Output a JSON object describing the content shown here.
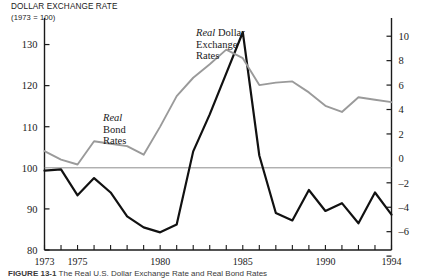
{
  "figure": {
    "title": "DOLLAR EXCHANGE RATE",
    "subtitle": "(1973 = 100)",
    "caption_label": "FIGURE",
    "caption_number": "13-1",
    "caption_text": "The Real U.S. Dollar Exchange Rate and Real Bond Rates"
  },
  "annotations": {
    "bond": {
      "line1_italic": "Real",
      "line2": "Bond",
      "line3": "Rates"
    },
    "dollar": {
      "line1_italic": "Real",
      "line1_rest": " Dollar",
      "line2": "Exchange",
      "line3": "Rates"
    }
  },
  "axes": {
    "left_title": "DOLLAR EXCHANGE RATE",
    "left_ticks": [
      "130",
      "120",
      "110",
      "100",
      "90",
      "80"
    ],
    "right_ticks": [
      "10",
      "8",
      "6",
      "4",
      "2",
      "0",
      "–2",
      "–4",
      "–6"
    ],
    "x_ticks_labeled": [
      "1973",
      "1975",
      "1980",
      "1985",
      "1990",
      "1994"
    ]
  },
  "chart_data": {
    "type": "line",
    "title": "DOLLAR EXCHANGE RATE (1973 = 100)",
    "xlabel": "",
    "ylabel": "Dollar exchange rate index (1973 = 100)",
    "y2label": "Real bond rate (percent)",
    "xlim": [
      1973,
      1994
    ],
    "ylim": [
      80,
      135
    ],
    "y2lim": [
      -7.5,
      11.0
    ],
    "grid": false,
    "zero_line": true,
    "legend": "inline-annotations",
    "x": [
      1973,
      1974,
      1975,
      1976,
      1977,
      1978,
      1979,
      1980,
      1981,
      1982,
      1983,
      1984,
      1985,
      1986,
      1987,
      1988,
      1989,
      1990,
      1991,
      1992,
      1993,
      1994
    ],
    "series": [
      {
        "name": "Real Dollar Exchange Rates",
        "axis": "left",
        "color": "#111111",
        "label": "Real Dollar Exchange Rates",
        "values": [
          99.3,
          99.6,
          93.3,
          97.5,
          94.0,
          88.2,
          85.5,
          84.3,
          86.2,
          104.0,
          113.0,
          123.0,
          133.0,
          103.0,
          89.0,
          87.2,
          94.6,
          89.5,
          91.4,
          86.5,
          94.0,
          88.6
        ]
      },
      {
        "name": "Real Bond Rates",
        "axis": "right",
        "color": "#9a9a9a",
        "label": "Real Bond Rates",
        "values": [
          0.6,
          -0.1,
          -0.5,
          1.4,
          1.2,
          1.0,
          0.3,
          2.6,
          5.1,
          6.6,
          7.7,
          8.9,
          8.2,
          6.0,
          6.2,
          6.3,
          5.4,
          4.3,
          3.8,
          5.0,
          4.8,
          4.6
        ]
      }
    ]
  }
}
